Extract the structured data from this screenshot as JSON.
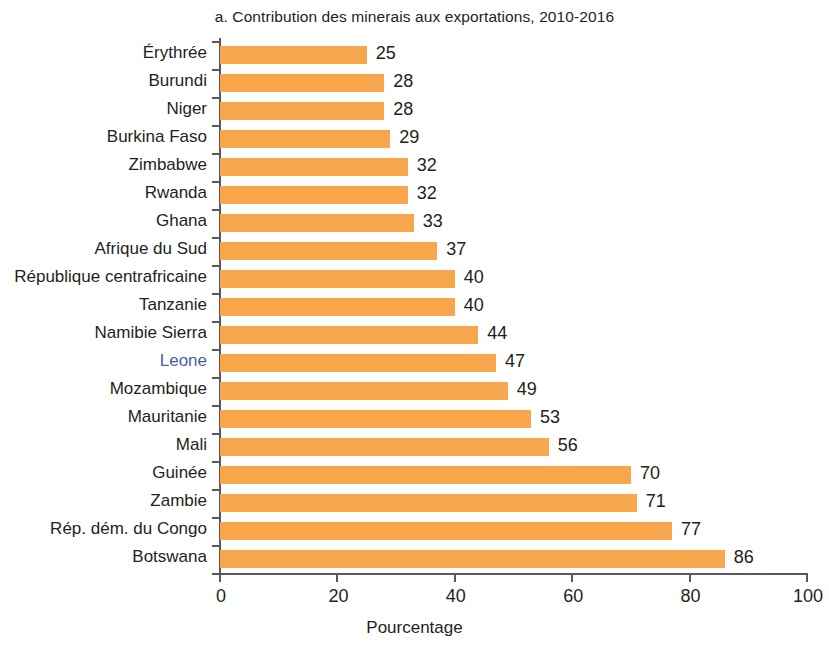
{
  "chart_data": {
    "type": "bar",
    "orientation": "horizontal",
    "title": "a. Contribution des minerais aux exportations, 2010-2016",
    "xlabel": "Pourcentage",
    "ylabel": "",
    "xlim": [
      0,
      100
    ],
    "xticks": [
      0,
      20,
      40,
      60,
      80,
      100
    ],
    "xtick_labels": [
      "0",
      "20",
      "40",
      "60",
      "80",
      "100"
    ],
    "grid": false,
    "legend": null,
    "bar_color": "#f7a64b",
    "value_labels": true,
    "categories": [
      "Érythrée",
      "Burundi",
      "Niger",
      "Burkina Faso",
      "Zimbabwe",
      "Rwanda",
      "Ghana",
      "Afrique du Sud",
      "République centrafricaine",
      "Tanzanie",
      "Namibie Sierra",
      "Leone",
      "Mozambique",
      "Mauritanie",
      "Mali",
      "Guinée",
      "Zambie",
      "Rép. dém. du Congo",
      "Botswana"
    ],
    "values": [
      25,
      28,
      28,
      29,
      32,
      32,
      33,
      37,
      40,
      40,
      44,
      47,
      49,
      53,
      56,
      70,
      71,
      77,
      86
    ],
    "value_label_text": [
      "25",
      "28",
      "28",
      "29",
      "32",
      "32",
      "33",
      "37",
      "40",
      "40",
      "44",
      "47",
      "49",
      "53",
      "56",
      "70",
      "71",
      "77",
      "86"
    ],
    "highlighted_categories": [
      "Leone"
    ],
    "highlight_color": "#4b5fa8"
  }
}
